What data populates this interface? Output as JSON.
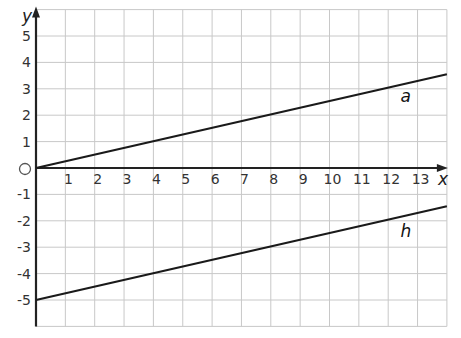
{
  "chart_data": {
    "type": "line",
    "title": "",
    "xlabel": "x",
    "ylabel": "y",
    "xlim": [
      0,
      14
    ],
    "ylim": [
      -6,
      6
    ],
    "grid": true,
    "x_ticks": [
      1,
      2,
      3,
      4,
      5,
      6,
      7,
      8,
      9,
      10,
      11,
      12,
      13
    ],
    "y_ticks": [
      5,
      4,
      3,
      2,
      1,
      -1,
      -2,
      -3,
      -4,
      -5
    ],
    "origin_label": "O",
    "series": [
      {
        "name": "a",
        "x": [
          0,
          14
        ],
        "y": [
          0,
          3.55
        ],
        "label_pos": [
          12.6,
          2.5
        ]
      },
      {
        "name": "h",
        "x": [
          0,
          14
        ],
        "y": [
          -5,
          -1.45
        ],
        "label_pos": [
          12.6,
          -2.6
        ]
      }
    ]
  },
  "colors": {
    "grid": "#c8c8c8",
    "axis": "#222222",
    "line": "#1a1a1a"
  }
}
